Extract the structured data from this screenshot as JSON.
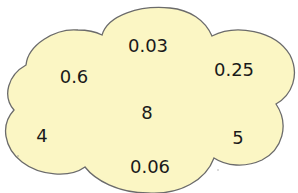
{
  "cloud": {
    "fill_color": "#fbf6c4",
    "stroke_color": "#6b6b6b"
  },
  "numbers": [
    {
      "id": "n1",
      "value": "0.03",
      "x": 148,
      "y": 46
    },
    {
      "id": "n2",
      "value": "0.6",
      "x": 74,
      "y": 77
    },
    {
      "id": "n3",
      "value": "0.25",
      "x": 234,
      "y": 70
    },
    {
      "id": "n4",
      "value": "8",
      "x": 147,
      "y": 113
    },
    {
      "id": "n5",
      "value": "4",
      "x": 42,
      "y": 136
    },
    {
      "id": "n6",
      "value": "5",
      "x": 238,
      "y": 138
    },
    {
      "id": "n7",
      "value": "0.06",
      "x": 150,
      "y": 167
    }
  ]
}
